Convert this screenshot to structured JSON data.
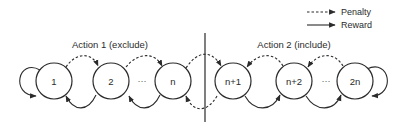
{
  "legend": {
    "penalty_label": "Penalty",
    "reward_label": "Reward"
  },
  "groups": {
    "left_title": "Action 1 (exclude)",
    "right_title": "Action 2 (include)"
  },
  "nodes": [
    {
      "id": "1",
      "label": "1"
    },
    {
      "id": "2",
      "label": "2"
    },
    {
      "id": "n",
      "label": "n"
    },
    {
      "id": "n+1",
      "label": "n+1"
    },
    {
      "id": "n+2",
      "label": "n+2"
    },
    {
      "id": "2n",
      "label": "2n"
    }
  ],
  "ellipsis": "···",
  "edges": [
    {
      "from": "1",
      "to": "1",
      "type": "reward"
    },
    {
      "from": "1",
      "to": "2",
      "type": "penalty"
    },
    {
      "from": "2",
      "to": "1",
      "type": "reward"
    },
    {
      "from": "2",
      "to": "n",
      "type": "penalty"
    },
    {
      "from": "n",
      "to": "2",
      "type": "reward"
    },
    {
      "from": "n",
      "to": "n+1",
      "type": "penalty"
    },
    {
      "from": "n+1",
      "to": "n",
      "type": "penalty"
    },
    {
      "from": "n+2",
      "to": "n+1",
      "type": "penalty"
    },
    {
      "from": "n+1",
      "to": "n+2",
      "type": "reward"
    },
    {
      "from": "2n",
      "to": "n+2",
      "type": "penalty"
    },
    {
      "from": "n+2",
      "to": "2n",
      "type": "reward"
    },
    {
      "from": "2n",
      "to": "2n",
      "type": "reward"
    }
  ]
}
